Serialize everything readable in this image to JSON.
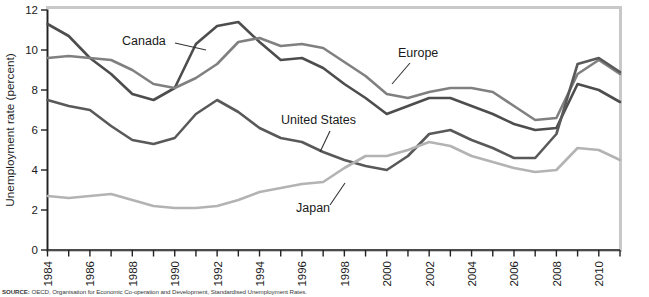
{
  "chart_data": {
    "type": "line",
    "title": "",
    "xlabel": "",
    "ylabel": "Unemployment rate (percent)",
    "ylim": [
      0,
      12
    ],
    "yticks": [
      0,
      2,
      4,
      6,
      8,
      10,
      12
    ],
    "xlim": [
      1984,
      2011
    ],
    "xticks": [
      1984,
      1986,
      1988,
      1990,
      1992,
      1994,
      1996,
      1998,
      2000,
      2002,
      2004,
      2006,
      2008,
      2010
    ],
    "xtick_labels": [
      "1984",
      "1986",
      "1988",
      "1990",
      "1992",
      "1994",
      "1996",
      "1998",
      "2000",
      "2002",
      "2004",
      "2006",
      "2008",
      "2010"
    ],
    "grid": false,
    "legend_position": "inline-annotations",
    "x": [
      1984,
      1985,
      1986,
      1987,
      1988,
      1989,
      1990,
      1991,
      1992,
      1993,
      1994,
      1995,
      1996,
      1997,
      1998,
      1999,
      2000,
      2001,
      2002,
      2003,
      2004,
      2005,
      2006,
      2007,
      2008,
      2009,
      2010,
      2011
    ],
    "series": [
      {
        "name": "Canada",
        "color": "#4d4d4d",
        "values": [
          11.3,
          10.7,
          9.6,
          8.8,
          7.8,
          7.5,
          8.1,
          10.3,
          11.2,
          11.4,
          10.4,
          9.5,
          9.6,
          9.1,
          8.3,
          7.6,
          6.8,
          7.2,
          7.6,
          7.6,
          7.2,
          6.8,
          6.3,
          6.0,
          6.1,
          8.3,
          8.0,
          7.4
        ]
      },
      {
        "name": "Europe",
        "color": "#808080",
        "values": [
          9.6,
          9.7,
          9.6,
          9.5,
          9.0,
          8.3,
          8.1,
          8.6,
          9.3,
          10.4,
          10.6,
          10.2,
          10.3,
          10.1,
          9.4,
          8.7,
          7.8,
          7.6,
          7.9,
          8.1,
          8.1,
          7.9,
          7.2,
          6.5,
          6.6,
          8.8,
          9.5,
          8.8
        ]
      },
      {
        "name": "United States",
        "color": "#595959",
        "values": [
          7.5,
          7.2,
          7.0,
          6.2,
          5.5,
          5.3,
          5.6,
          6.8,
          7.5,
          6.9,
          6.1,
          5.6,
          5.4,
          4.9,
          4.5,
          4.2,
          4.0,
          4.7,
          5.8,
          6.0,
          5.5,
          5.1,
          4.6,
          4.6,
          5.8,
          9.3,
          9.6,
          8.9
        ]
      },
      {
        "name": "Japan",
        "color": "#b3b3b3",
        "values": [
          2.7,
          2.6,
          2.7,
          2.8,
          2.5,
          2.2,
          2.1,
          2.1,
          2.2,
          2.5,
          2.9,
          3.1,
          3.3,
          3.4,
          4.1,
          4.7,
          4.7,
          5.0,
          5.4,
          5.2,
          4.7,
          4.4,
          4.1,
          3.9,
          4.0,
          5.1,
          5.0,
          4.5
        ]
      }
    ],
    "annotations": [
      {
        "label": "Canada",
        "text_x": 122,
        "text_y": 45,
        "leader": [
          [
            175,
            43
          ],
          [
            206,
            50
          ]
        ]
      },
      {
        "label": "Europe",
        "text_x": 398,
        "text_y": 57,
        "leader": [
          [
            410,
            63
          ],
          [
            392,
            84
          ]
        ]
      },
      {
        "label": "United States",
        "text_x": 281,
        "text_y": 124,
        "leader": [
          [
            330,
            131
          ],
          [
            320,
            152
          ]
        ]
      },
      {
        "label": "Japan",
        "text_x": 296,
        "text_y": 212,
        "leader": [
          [
            330,
            205
          ],
          [
            345,
            183
          ]
        ]
      }
    ]
  },
  "figure": {
    "source_note_bold": "SOURCE:",
    "source_note": "OECD, Organisation for Economic Co-operation and Development, Standardised Unemployment Rates."
  }
}
